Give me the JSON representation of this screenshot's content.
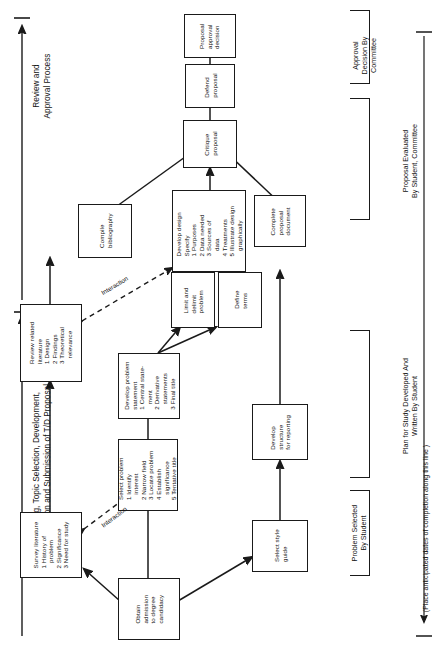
{
  "page": {
    "width": 441,
    "height": 659,
    "background": "#ffffff",
    "ink": "#1a1a1a"
  },
  "axis": {
    "phase_one_title": "Planning, Topic Selection, Development,\nPreparation and Submission of T/D Proposal",
    "phase_two_title": "Review and\nApproval Process",
    "timeline_note": "(Place anticipated dates of completion along this line )"
  },
  "edge_labels": {
    "interaction_upper": "Interaction",
    "interaction_lower": "Interaction"
  },
  "brackets": [
    {
      "id": "problem-selected",
      "label": "Problem Selected\nBy Student"
    },
    {
      "id": "plan-for-study",
      "label": "Plan for Study Developed And\nWritten By Student"
    },
    {
      "id": "proposal-evaluated",
      "label": "Proposal Evaluated\nBy Student, Committee"
    },
    {
      "id": "approval-decision",
      "label": "Approval\nDecision By\nCommittee"
    }
  ],
  "nodes": {
    "obtain_admission": "Obtain\nadmission\nto degree\ncandidacy",
    "select_style_guide": "Select style\nguide",
    "survey_literature": "Survey literature\n1 History of\n   problem\n2 Significance\n3 Need for study",
    "select_problem": "Select problem\n1 Identify\n   interest\n2 Narrow field\n3 Locate problem\n4 Establish\n   significance\n5 Tentative title",
    "develop_structure": "Develop\nstructure\nfor reporting",
    "review_related_literature": "Review related\nliterature\n1 Design\n2 Findings\n3 Theoretical\n   relevance",
    "develop_problem_statement": "Develop problem\nstatement\n1 Central state-\n   ment\n2 Derivative\n   statements\n3 Final title",
    "limit_delimit_problem": "Limit and\ndelimit\nproblem",
    "define_terms": "Define\nterms",
    "compile_bibliography": "Compile\nbibliography",
    "develop_design": "Develop design\nSpecify\n1 Purposes\n2 Data needed\n3 Sources of\n   data\n4 Treatments\n5 Illustrate design\n   graphically",
    "complete_proposal_document": "Complete\nproposal\ndocument",
    "critique_proposal": "Critique\nproposal",
    "defend_proposal": "Defend\nproposal",
    "proposal_approval_decision": "Proposal\napproval\ndecision"
  }
}
